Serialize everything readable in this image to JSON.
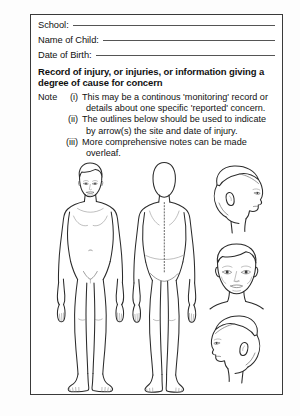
{
  "form": {
    "fields": [
      {
        "label": "School:",
        "value": ""
      },
      {
        "label": "Name of Child:",
        "value": ""
      },
      {
        "label": "Date of Birth:",
        "value": ""
      }
    ],
    "heading": "Record of injury, or injuries, or information giving a degree of cause for concern",
    "notes": {
      "word": "Note",
      "items": [
        {
          "numeral": "(i)",
          "line1": "This may be a continous 'monitoring' record or",
          "line2": "details about one specific 'reported' concern."
        },
        {
          "numeral": "(ii)",
          "line1": "The outlines below should be used to indicate",
          "line2": "by arrow(s) the site and date of injury."
        },
        {
          "numeral": "(iii)",
          "line1": "More comprehensive notes can be made",
          "line2": "overleaf."
        }
      ]
    },
    "figures": [
      {
        "name": "body-front-view"
      },
      {
        "name": "body-back-view"
      },
      {
        "name": "head-right-profile"
      },
      {
        "name": "head-front-view"
      },
      {
        "name": "head-left-profile"
      }
    ]
  },
  "colors": {
    "ink": "#2b2b2b",
    "rule": "#555555",
    "frame": "#3a3a3a",
    "paper": "#ffffff",
    "background": "#fdfdfd"
  }
}
